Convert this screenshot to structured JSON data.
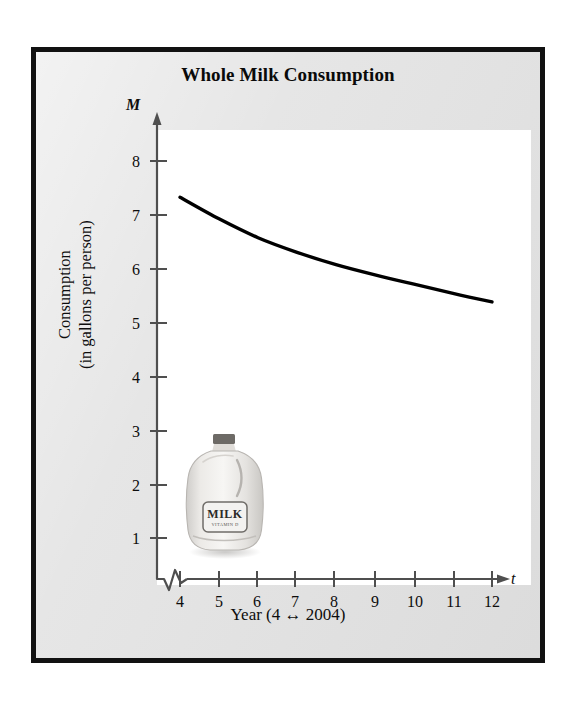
{
  "figure": {
    "title": "Whole Milk Consumption",
    "frame_color": "#111111",
    "card_color": "#e3e3e3",
    "plot_background": "#ffffff",
    "curve_color": "#000000"
  },
  "axes": {
    "y_variable": "M",
    "x_variable": "t",
    "y_title_line1": "Consumption",
    "y_title_line2": "(in gallons per person)",
    "x_title": "Year (4 ↔ 2004)",
    "y_ticks": [
      "1",
      "2",
      "3",
      "4",
      "5",
      "6",
      "7",
      "8"
    ],
    "x_ticks": [
      "4",
      "5",
      "6",
      "7",
      "8",
      "9",
      "10",
      "11",
      "12"
    ],
    "axis_break": "zigzag"
  },
  "illustration": {
    "name": "milk-gallon-jug",
    "label_text": "MILK",
    "label_subtext": "VITAMIN D",
    "cap_color": "#6d6a66",
    "body_color": "#efeeec"
  },
  "chart_data": {
    "type": "line",
    "title": "Whole Milk Consumption",
    "xlabel": "Year (4 ↔ 2004)",
    "ylabel": "Consumption (in gallons per person)",
    "xlim": [
      4,
      12
    ],
    "ylim": [
      0,
      8.6
    ],
    "xticks": [
      4,
      5,
      6,
      7,
      8,
      9,
      10,
      11,
      12
    ],
    "yticks": [
      1,
      2,
      3,
      4,
      5,
      6,
      7,
      8
    ],
    "grid": false,
    "legend": "none",
    "axis_break_on_x": true,
    "axis_break_on_y": true,
    "series": [
      {
        "name": "Whole milk consumption",
        "x": [
          4,
          5,
          6,
          7,
          8,
          9,
          10,
          11,
          12
        ],
        "values": [
          7.33,
          6.93,
          6.58,
          6.31,
          6.08,
          5.89,
          5.72,
          5.55,
          5.39
        ]
      }
    ]
  }
}
